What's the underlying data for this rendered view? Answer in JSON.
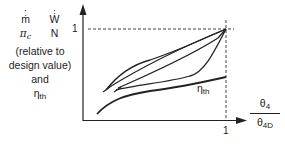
{
  "diagram": {
    "y_axis_label": {
      "row1": [
        "ṁ",
        "Ẇ"
      ],
      "row2_pi": "π",
      "row2_pi_sub": "c",
      "row2_N": "N",
      "row3": "(relative to",
      "row4": "design value)",
      "row5": "and",
      "row6_eta": "η",
      "row6_eta_sub": "th"
    },
    "y_tick": "1",
    "x_tick": "1",
    "x_axis_label": {
      "numerator": "θ",
      "numerator_sub": "4",
      "denominator": "θ",
      "denominator_sub": "4D"
    },
    "curve_label": {
      "symbol": "η",
      "sub": "th"
    },
    "curves": [
      {
        "name": "upper-curve",
        "description": "concave, rises from lower-left to design point (1,1)"
      },
      {
        "name": "middle-curve-1",
        "description": "near-linear to design point"
      },
      {
        "name": "middle-curve-2",
        "description": "near-linear to design point"
      },
      {
        "name": "lower-curve",
        "description": "convex, flat then rising sharply to design point"
      },
      {
        "name": "eta-th-curve",
        "description": "thermal efficiency, rises then flattens, ends below design point at x=1"
      }
    ],
    "colors": {
      "line": "#222222",
      "dashed": "#444444",
      "background": "#ffffff"
    }
  }
}
